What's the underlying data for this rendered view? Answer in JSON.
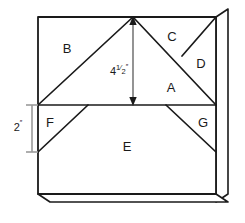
{
  "drawing": {
    "title": "Roof truss section layout",
    "stroke_color": "#1a1a1a",
    "fill_color": "#ffffff",
    "dimension_color": "#8c8c8c",
    "regions": [
      {
        "id": "A",
        "label": "A",
        "x": 171,
        "y": 89
      },
      {
        "id": "B",
        "label": "B",
        "x": 67,
        "y": 50
      },
      {
        "id": "C",
        "label": "C",
        "x": 172,
        "y": 38
      },
      {
        "id": "D",
        "label": "D",
        "x": 201,
        "y": 65
      },
      {
        "id": "E",
        "label": "E",
        "x": 127,
        "y": 148
      },
      {
        "id": "F",
        "label": "F",
        "x": 50,
        "y": 124
      },
      {
        "id": "G",
        "label": "G",
        "x": 203,
        "y": 124
      }
    ],
    "dimensions": [
      {
        "id": "height-dimension",
        "whole": "4",
        "numerator": "1",
        "denominator": "2",
        "unit": "″",
        "value_text": "4 1/2\"",
        "label_x": 119,
        "label_y": 72,
        "orientation": "vertical",
        "from_y": 17,
        "to_y": 105,
        "at_x": 133
      },
      {
        "id": "wall-height-dimension",
        "whole": "2",
        "numerator": "",
        "denominator": "",
        "unit": "″",
        "value_text": "2\"",
        "label_x": 20,
        "label_y": 128,
        "orientation": "vertical",
        "from_y": 105,
        "to_y": 152,
        "at_x": 32
      }
    ]
  }
}
